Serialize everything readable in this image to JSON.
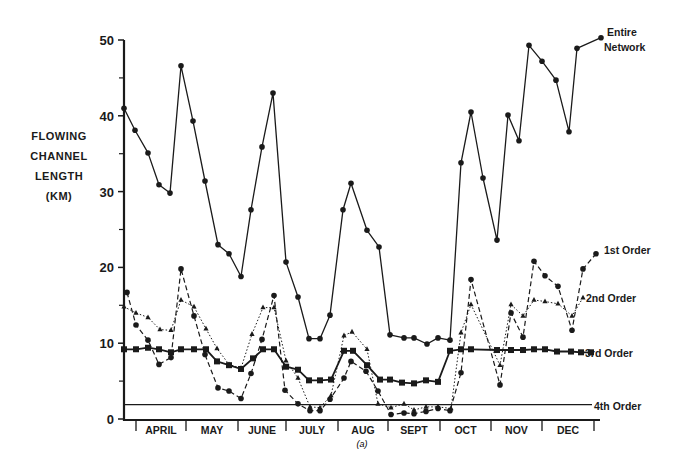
{
  "chart_data": {
    "type": "line",
    "title": "",
    "caption": "(a)",
    "ylabel_lines": [
      "FLOWING",
      "CHANNEL",
      "LENGTH",
      "(KM)"
    ],
    "ylabel": "FLOWING CHANNEL LENGTH (KM)",
    "xlabel": "",
    "ylim": [
      0,
      50
    ],
    "yticks": [
      0,
      10,
      20,
      30,
      40,
      50
    ],
    "y_minor_ticks": [
      5,
      15,
      25,
      35,
      45
    ],
    "month_labels": [
      "APRIL",
      "MAY",
      "JUNE",
      "JULY",
      "AUG",
      "SEPT",
      "OCT",
      "NOV",
      "DEC"
    ],
    "grid": false,
    "legend_position": "inline labels at right end of each series",
    "series": [
      {
        "name": "Entire Network",
        "label_lines": [
          "Entire",
          "Network"
        ],
        "style": "solid",
        "marker": "circle",
        "x": [
          124,
          135,
          148,
          159,
          170,
          181,
          193,
          205,
          218,
          229,
          241,
          251,
          262,
          273,
          286,
          298,
          309,
          320,
          330,
          343,
          351,
          367,
          379,
          390,
          404,
          414,
          427,
          438,
          450,
          461,
          471,
          483,
          497,
          508,
          519,
          529,
          542,
          556,
          569,
          577,
          601
        ],
        "values": [
          41.0,
          38.1,
          35.1,
          30.9,
          29.8,
          46.6,
          39.3,
          31.4,
          23.0,
          21.8,
          18.8,
          27.6,
          35.9,
          43.0,
          20.7,
          16.1,
          10.6,
          10.6,
          13.7,
          27.6,
          31.1,
          24.9,
          22.7,
          11.1,
          10.7,
          10.7,
          9.9,
          10.7,
          10.4,
          33.8,
          40.5,
          31.8,
          23.6,
          40.1,
          36.7,
          49.3,
          47.2,
          44.7,
          37.9,
          48.9,
          50.3
        ]
      },
      {
        "name": "1st Order",
        "label_lines": [
          "1st Order"
        ],
        "style": "dashed",
        "marker": "circle",
        "x": [
          127,
          136,
          148,
          159,
          171,
          181,
          194,
          205,
          218,
          229,
          241,
          251,
          262,
          274,
          285,
          298,
          310,
          320,
          330,
          344,
          351,
          366,
          378,
          391,
          404,
          414,
          426,
          438,
          450,
          461,
          471,
          500,
          511,
          523,
          534,
          545,
          558,
          572,
          583,
          596
        ],
        "values": [
          16.7,
          12.4,
          10.4,
          7.2,
          8.1,
          19.8,
          13.6,
          8.5,
          4.1,
          3.7,
          2.7,
          6.0,
          10.5,
          16.3,
          3.8,
          2.0,
          1.1,
          1.1,
          2.6,
          5.4,
          7.6,
          6.3,
          3.7,
          0.6,
          0.8,
          0.7,
          1.0,
          1.4,
          1.1,
          6.1,
          18.4,
          4.5,
          14.0,
          10.8,
          20.8,
          18.9,
          17.5,
          11.7,
          19.8,
          21.8
        ]
      },
      {
        "name": "2nd Order",
        "label_lines": [
          "2nd Order"
        ],
        "style": "dotted",
        "marker": "triangle",
        "x": [
          124,
          136,
          148,
          160,
          171,
          181,
          194,
          206,
          217,
          229,
          241,
          252,
          263,
          274,
          286,
          298,
          310,
          320,
          331,
          344,
          352,
          367,
          378,
          391,
          404,
          414,
          426,
          438,
          451,
          461,
          471,
          500,
          511,
          523,
          534,
          545,
          558,
          572,
          583
        ],
        "values": [
          14.8,
          14.0,
          13.4,
          11.8,
          11.7,
          15.7,
          14.8,
          11.9,
          9.3,
          7.2,
          6.7,
          11.2,
          14.7,
          14.7,
          7.7,
          5.4,
          1.6,
          1.5,
          3.1,
          11.0,
          11.5,
          9.2,
          2.0,
          1.5,
          2.0,
          1.2,
          1.6,
          1.6,
          1.4,
          11.4,
          15.1,
          7.1,
          15.1,
          13.6,
          15.7,
          15.5,
          15.2,
          13.6,
          16.0
        ]
      },
      {
        "name": "3rd Order",
        "label_lines": [
          "3rd Order"
        ],
        "style": "solid-bold",
        "marker": "square",
        "x": [
          124,
          136,
          148,
          159,
          171,
          181,
          194,
          206,
          217,
          229,
          241,
          253,
          263,
          274,
          286,
          298,
          309,
          320,
          331,
          344,
          353,
          367,
          380,
          390,
          402,
          414,
          426,
          438,
          450,
          461,
          471,
          497,
          511,
          523,
          534,
          545,
          557,
          571,
          581,
          591
        ],
        "values": [
          9.2,
          9.2,
          9.4,
          9.2,
          8.8,
          9.2,
          9.2,
          9.2,
          7.6,
          7.1,
          6.6,
          8.0,
          9.2,
          9.2,
          6.9,
          6.5,
          5.1,
          5.1,
          5.2,
          9.0,
          9.0,
          7.1,
          5.2,
          5.2,
          4.8,
          4.7,
          5.1,
          4.9,
          9.0,
          9.2,
          9.2,
          9.1,
          9.1,
          9.1,
          9.2,
          9.2,
          8.9,
          8.9,
          8.8,
          8.8
        ]
      },
      {
        "name": "4th Order",
        "label_lines": [
          "4th Order"
        ],
        "style": "solid-thin",
        "marker": "none",
        "x": [
          124,
          592
        ],
        "values": [
          1.9,
          1.9
        ]
      }
    ]
  }
}
